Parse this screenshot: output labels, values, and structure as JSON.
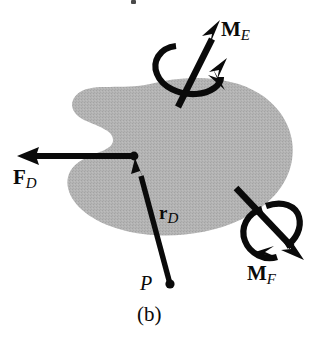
{
  "figure": {
    "caption": "(b)",
    "kind": "free-body-diagram",
    "body_fill": "#b0b0b0",
    "ink_color": "#0a0a0a",
    "background": "#ffffff"
  },
  "labels": {
    "force": {
      "symbol": "F",
      "subscript": "D"
    },
    "position_vector": {
      "symbol": "r",
      "subscript": "D"
    },
    "moment_e": {
      "symbol": "M",
      "subscript": "E"
    },
    "moment_f": {
      "symbol": "M",
      "subscript": "F"
    },
    "point_p": "P"
  },
  "vectors": [
    {
      "name": "force-FD",
      "label": "F_D",
      "type": "straight-arrow",
      "from": [
        134,
        156
      ],
      "to": [
        19,
        156
      ],
      "direction": "left",
      "note": "applied at point D on the body edge"
    },
    {
      "name": "position-vector-rD",
      "label": "r_D",
      "type": "straight-arrow",
      "from": [
        170,
        284
      ],
      "to": [
        135,
        158
      ],
      "direction": "up-left",
      "note": "from point P to point D"
    },
    {
      "name": "moment-ME",
      "label": "M_E",
      "type": "double-headed-curl-arrow",
      "from": [
        178,
        106
      ],
      "to": [
        220,
        21
      ],
      "direction": "up-right",
      "curl": "counterclockwise about axis"
    },
    {
      "name": "moment-MF",
      "label": "M_F",
      "type": "double-headed-curl-arrow",
      "from": [
        236,
        188
      ],
      "to": [
        303,
        259
      ],
      "direction": "down-right",
      "curl": "counterclockwise about axis"
    }
  ],
  "points": [
    {
      "name": "point-D",
      "label": "",
      "at": [
        134,
        156
      ]
    },
    {
      "name": "point-P",
      "label": "P",
      "at": [
        170,
        285
      ]
    }
  ]
}
